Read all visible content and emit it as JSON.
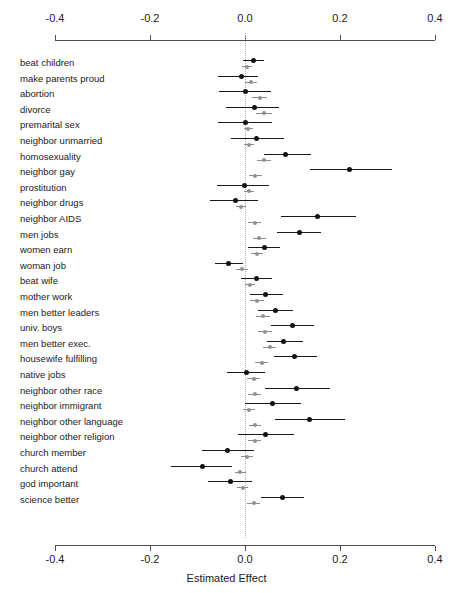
{
  "chart_data": {
    "type": "scatter",
    "title": "",
    "xlabel": "Estimated Effect",
    "ylabel": "",
    "xlim": [
      -0.4,
      0.4
    ],
    "xticks": [
      -0.4,
      -0.2,
      0.0,
      0.2,
      0.4
    ],
    "xticklabels": [
      "-0.4",
      "-0.2",
      "0.0",
      "0.2",
      "0.4"
    ],
    "grid": false,
    "legend": "none",
    "zero_reference_line": 0.0,
    "orientation": "horizontal-forest-plot",
    "series": [
      {
        "name": "primary",
        "color": "#111111",
        "marker": "filled-circle"
      },
      {
        "name": "secondary",
        "color": "#919191",
        "marker": "filled-circle"
      }
    ],
    "categories": [
      "beat children",
      "make parents proud",
      "abortion",
      "divorce",
      "premarital sex",
      "neighbor unmarried",
      "homosexuality",
      "neighbor gay",
      "prostitution",
      "neighbor drugs",
      "neighbor AIDS",
      "men jobs",
      "women earn",
      "woman job",
      "beat wife",
      "mother work",
      "men better leaders",
      "univ. boys",
      "men better exec.",
      "housewife fulfilling",
      "native jobs",
      "neighbor other race",
      "neighbor immigrant",
      "neighbor other language",
      "neighbor other religion",
      "church member",
      "church attend",
      "god important",
      "science better"
    ],
    "points": [
      {
        "category": "beat children",
        "primary": {
          "value": 0.017,
          "low": -0.004,
          "high": 0.04
        },
        "secondary": {
          "value": 0.004,
          "low": -0.006,
          "high": 0.014
        }
      },
      {
        "category": "make parents proud",
        "primary": {
          "value": -0.008,
          "low": -0.057,
          "high": 0.028
        },
        "secondary": {
          "value": 0.013,
          "low": 0.0,
          "high": 0.026
        }
      },
      {
        "category": "abortion",
        "primary": {
          "value": 0.0,
          "low": -0.055,
          "high": 0.055
        },
        "secondary": {
          "value": 0.031,
          "low": 0.014,
          "high": 0.047
        }
      },
      {
        "category": "divorce",
        "primary": {
          "value": 0.019,
          "low": -0.04,
          "high": 0.072
        },
        "secondary": {
          "value": 0.04,
          "low": 0.024,
          "high": 0.056
        }
      },
      {
        "category": "premarital sex",
        "primary": {
          "value": 0.0,
          "low": -0.057,
          "high": 0.056
        },
        "secondary": {
          "value": 0.007,
          "low": -0.003,
          "high": 0.017
        }
      },
      {
        "category": "neighbor unmarried",
        "primary": {
          "value": 0.025,
          "low": -0.03,
          "high": 0.083
        },
        "secondary": {
          "value": 0.008,
          "low": -0.002,
          "high": 0.018
        }
      },
      {
        "category": "homosexuality",
        "primary": {
          "value": 0.086,
          "low": 0.041,
          "high": 0.139
        },
        "secondary": {
          "value": 0.04,
          "low": 0.025,
          "high": 0.055
        }
      },
      {
        "category": "neighbor gay",
        "primary": {
          "value": 0.221,
          "low": 0.137,
          "high": 0.31
        },
        "secondary": {
          "value": 0.022,
          "low": 0.008,
          "high": 0.036
        }
      },
      {
        "category": "prostitution",
        "primary": {
          "value": -0.002,
          "low": -0.06,
          "high": 0.05
        },
        "secondary": {
          "value": 0.008,
          "low": -0.003,
          "high": 0.019
        }
      },
      {
        "category": "neighbor drugs",
        "primary": {
          "value": -0.02,
          "low": -0.073,
          "high": 0.028
        },
        "secondary": {
          "value": -0.008,
          "low": -0.02,
          "high": 0.003
        }
      },
      {
        "category": "neighbor AIDS",
        "primary": {
          "value": 0.153,
          "low": 0.075,
          "high": 0.233
        },
        "secondary": {
          "value": 0.02,
          "low": 0.006,
          "high": 0.034
        }
      },
      {
        "category": "men jobs",
        "primary": {
          "value": 0.114,
          "low": 0.068,
          "high": 0.16
        },
        "secondary": {
          "value": 0.03,
          "low": 0.016,
          "high": 0.045
        }
      },
      {
        "category": "women earn",
        "primary": {
          "value": 0.04,
          "low": 0.006,
          "high": 0.074
        },
        "secondary": {
          "value": 0.025,
          "low": 0.012,
          "high": 0.038
        }
      },
      {
        "category": "woman job",
        "primary": {
          "value": -0.034,
          "low": -0.064,
          "high": -0.004
        },
        "secondary": {
          "value": -0.006,
          "low": -0.018,
          "high": 0.006
        }
      },
      {
        "category": "beat wife",
        "primary": {
          "value": 0.024,
          "low": -0.008,
          "high": 0.056
        },
        "secondary": {
          "value": 0.01,
          "low": -0.001,
          "high": 0.021
        }
      },
      {
        "category": "mother work",
        "primary": {
          "value": 0.044,
          "low": 0.01,
          "high": 0.08
        },
        "secondary": {
          "value": 0.025,
          "low": 0.011,
          "high": 0.039
        }
      },
      {
        "category": "men better leaders",
        "primary": {
          "value": 0.065,
          "low": 0.028,
          "high": 0.101
        },
        "secondary": {
          "value": 0.038,
          "low": 0.024,
          "high": 0.052
        }
      },
      {
        "category": "univ. boys",
        "primary": {
          "value": 0.099,
          "low": 0.055,
          "high": 0.145
        },
        "secondary": {
          "value": 0.042,
          "low": 0.028,
          "high": 0.056
        }
      },
      {
        "category": "men better exec.",
        "primary": {
          "value": 0.082,
          "low": 0.046,
          "high": 0.122
        },
        "secondary": {
          "value": 0.052,
          "low": 0.038,
          "high": 0.066
        }
      },
      {
        "category": "housewife fulfilling",
        "primary": {
          "value": 0.105,
          "low": 0.06,
          "high": 0.152
        },
        "secondary": {
          "value": 0.035,
          "low": 0.021,
          "high": 0.049
        }
      },
      {
        "category": "native jobs",
        "primary": {
          "value": 0.003,
          "low": -0.037,
          "high": 0.043
        },
        "secondary": {
          "value": 0.018,
          "low": 0.005,
          "high": 0.031
        }
      },
      {
        "category": "neighbor other race",
        "primary": {
          "value": 0.108,
          "low": 0.042,
          "high": 0.178
        },
        "secondary": {
          "value": 0.02,
          "low": 0.007,
          "high": 0.033
        }
      },
      {
        "category": "neighbor immigrant",
        "primary": {
          "value": 0.058,
          "low": 0.001,
          "high": 0.118
        },
        "secondary": {
          "value": 0.008,
          "low": -0.005,
          "high": 0.021
        }
      },
      {
        "category": "neighbor other language",
        "primary": {
          "value": 0.135,
          "low": 0.064,
          "high": 0.21
        },
        "secondary": {
          "value": 0.021,
          "low": 0.008,
          "high": 0.034
        }
      },
      {
        "category": "neighbor other religion",
        "primary": {
          "value": 0.043,
          "low": -0.015,
          "high": 0.103
        },
        "secondary": {
          "value": 0.02,
          "low": 0.007,
          "high": 0.033
        }
      },
      {
        "category": "church member",
        "primary": {
          "value": -0.036,
          "low": -0.09,
          "high": 0.018
        },
        "secondary": {
          "value": 0.004,
          "low": -0.008,
          "high": 0.016
        }
      },
      {
        "category": "church attend",
        "primary": {
          "value": -0.089,
          "low": -0.155,
          "high": -0.028
        },
        "secondary": {
          "value": -0.01,
          "low": -0.022,
          "high": 0.002
        }
      },
      {
        "category": "god important",
        "primary": {
          "value": -0.03,
          "low": -0.078,
          "high": 0.015
        },
        "secondary": {
          "value": -0.005,
          "low": -0.017,
          "high": 0.007
        }
      },
      {
        "category": "science better",
        "primary": {
          "value": 0.078,
          "low": 0.034,
          "high": 0.124
        },
        "secondary": {
          "value": 0.018,
          "low": 0.004,
          "high": 0.032
        }
      }
    ]
  },
  "axis": {
    "title": "Estimated Effect",
    "ticks": [
      "-0.4",
      "-0.2",
      "0.0",
      "0.2",
      "0.4"
    ]
  }
}
